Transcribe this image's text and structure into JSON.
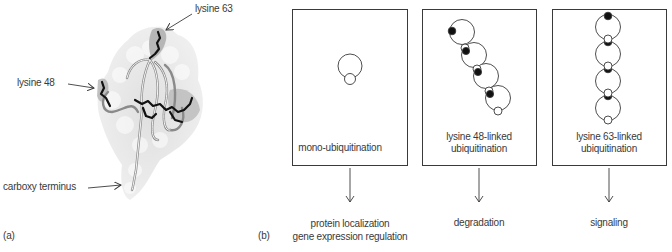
{
  "panel_a": {
    "caption": "(a)",
    "labels": {
      "lysine63": "lysine 63",
      "lysine48": "lysine 48",
      "carboxy": "carboxy terminus"
    },
    "image": "ubiquitin-protein-structure"
  },
  "panel_b": {
    "caption": "(b)",
    "boxes": [
      {
        "label_line1": "mono-ubiquitination",
        "label_line2": "",
        "outcome_line1": "protein localization",
        "outcome_line2": "gene expression regulation"
      },
      {
        "label_line1": "lysine 48-linked",
        "label_line2": "ubiquitination",
        "outcome_line1": "degradation",
        "outcome_line2": ""
      },
      {
        "label_line1": "lysine 63-linked",
        "label_line2": "ubiquitination",
        "outcome_line1": "signaling",
        "outcome_line2": ""
      }
    ]
  },
  "colors": {
    "line": "#3a3a3a",
    "surface": "#e6e6e6",
    "highlight": "#9a9a9a",
    "residue": "#111111"
  }
}
